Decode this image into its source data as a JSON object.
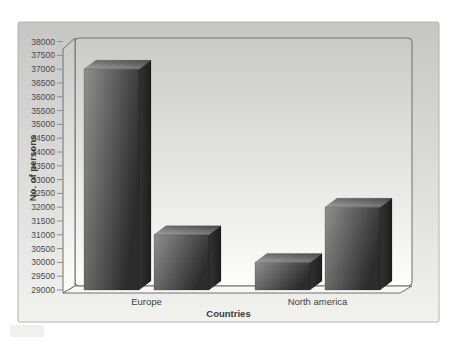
{
  "chart_data": {
    "type": "bar",
    "projection": "3d",
    "title": "",
    "xlabel": "Countries",
    "ylabel": "No. of persons",
    "categories": [
      "Europe",
      "North america"
    ],
    "series": [
      {
        "name": "series-1",
        "values": [
          37000,
          30000
        ]
      },
      {
        "name": "series-2",
        "values": [
          31000,
          32000
        ]
      }
    ],
    "bars_in_order": [
      {
        "category": "Europe",
        "value": 37000
      },
      {
        "category": "Europe",
        "value": 31000
      },
      {
        "category": "North america",
        "value": 30000
      },
      {
        "category": "North america",
        "value": 32000
      }
    ],
    "ylim": [
      29000,
      38000
    ],
    "ytick_step": 500,
    "yticks": [
      29000,
      29500,
      30000,
      30500,
      31000,
      31500,
      32000,
      32500,
      33000,
      33500,
      34000,
      34500,
      35000,
      35500,
      36000,
      36500,
      37000,
      37500,
      38000
    ],
    "legend": false,
    "grid": false
  },
  "colors": {
    "page_bg": "#ffffff",
    "figure_bg_top": "#c6c6c4",
    "figure_bg_bottom": "#f2f2ef",
    "figure_border": "#b5b2ac",
    "wall_bg_top": "#cacac8",
    "wall_bg_bottom": "#fdfdfb",
    "wall_border": "#6f6f6f",
    "floor_fill": "#f7f7f5",
    "tick_color": "#8a8a8a",
    "text_color": "#3f3f3f",
    "bar_front_light": "#8f8f8f",
    "bar_front_dark": "#2c2c2c",
    "bar_top_light": "#a2a2a2",
    "bar_top_dark": "#4c4c4c",
    "bar_side_light": "#333333",
    "bar_side_dark": "#1d1d1d",
    "scan_artifact": "#e6e6e3"
  }
}
